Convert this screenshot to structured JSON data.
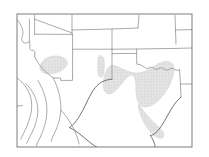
{
  "figure": {
    "type": "thematic-map",
    "region": "Southwestern and South-Central United States",
    "title": "",
    "caption": "",
    "background_color": "#ffffff",
    "frame": {
      "name": "map-frame",
      "stroke_color": "#6e6e6e",
      "stroke_width": 0.9,
      "x": 17,
      "y": 14,
      "width": 175,
      "height": 133
    },
    "line_styles": {
      "state_border_color": "#8a8a8a",
      "state_border_width": 0.75,
      "coast_border_color": "#6b6b6b",
      "coast_border_width": 0.9,
      "shaded_region_fill": "#dcdcdc",
      "shaded_region_stroke": "#c9c9c9",
      "stipple_dot_color": "#c4c4c4"
    },
    "shaded_regions": [
      {
        "name": "shaded-region-texas",
        "label": "Texas core area",
        "fill": "#dcdcdc",
        "pattern": "stipple"
      },
      {
        "name": "shaded-region-arizona",
        "label": "Southern Arizona area",
        "fill": "#dcdcdc",
        "pattern": "stipple"
      },
      {
        "name": "shaded-region-new-mexico",
        "label": "Eastern New Mexico strip",
        "fill": "#dcdcdc",
        "pattern": "stipple"
      }
    ],
    "boundaries": [
      {
        "name": "boundary-west-coast",
        "label": "Pacific coast and California border"
      },
      {
        "name": "boundary-utah-colorado",
        "label": "Utah and Colorado line"
      },
      {
        "name": "boundary-arizona-new-mexico",
        "label": "Arizona and New Mexico line"
      },
      {
        "name": "boundary-colorado-new-mexico",
        "label": "Colorado and New Mexico line"
      },
      {
        "name": "boundary-oklahoma-panhandle",
        "label": "Oklahoma panhandle"
      },
      {
        "name": "boundary-red-river",
        "label": "Texas and Oklahoma Red River line"
      },
      {
        "name": "boundary-kansas-missouri",
        "label": "Kansas and Missouri line"
      },
      {
        "name": "boundary-arkansas-louisiana",
        "label": "Arkansas and Louisiana line"
      },
      {
        "name": "boundary-gulf-coast",
        "label": "Gulf of Mexico coastline"
      },
      {
        "name": "boundary-mexico",
        "label": "Mexico international border and states"
      }
    ]
  }
}
